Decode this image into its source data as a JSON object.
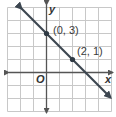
{
  "chart_data": {
    "type": "line",
    "title": "",
    "xlabel": "x",
    "ylabel": "y",
    "origin_label": "O",
    "xlim": [
      -3,
      5
    ],
    "ylim": [
      -3,
      5
    ],
    "grid": true,
    "grid_step": 1,
    "legend": null,
    "series": [
      {
        "name": "line through (0, 3) and (2, 1)",
        "equation": "y = -x + 3",
        "x": [
          -2,
          5
        ],
        "y": [
          5,
          -2
        ],
        "arrows": "both"
      }
    ],
    "points": [
      {
        "x": 0,
        "y": 3,
        "label": "(0, 3)"
      },
      {
        "x": 2,
        "y": 1,
        "label": "(2, 1)"
      }
    ],
    "colors": {
      "grid": "#c8c8c8",
      "axes": "#555555",
      "line": "#3c4650",
      "points": "#2f3a44"
    }
  }
}
